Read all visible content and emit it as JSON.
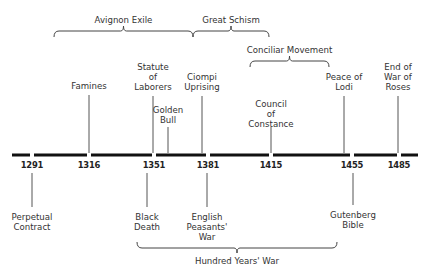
{
  "header": {
    "cropped_title_fragment": ""
  },
  "timeline": {
    "line": {
      "y": 155,
      "x_start": 12,
      "x_end": 418,
      "thickness": 3,
      "color": "#111111"
    },
    "ticks": [
      {
        "year": "1291",
        "x": 32
      },
      {
        "year": "1316",
        "x": 89
      },
      {
        "year": "1351",
        "x": 154
      },
      {
        "year": "1381",
        "x": 208
      },
      {
        "year": "1415",
        "x": 271
      },
      {
        "year": "1455",
        "x": 352
      },
      {
        "year": "1485",
        "x": 399
      }
    ],
    "events_above": [
      {
        "label": "Famines",
        "x": 89,
        "line_top": 95,
        "text_top": 81
      },
      {
        "label": "Statute\nof\nLaborers",
        "x": 153,
        "line_top": 96,
        "text_top": 62
      },
      {
        "label": "Golden\nBull",
        "x": 168,
        "line_top": 127,
        "text_top": 105
      },
      {
        "label": "Ciompi\nUprising",
        "x": 202,
        "line_top": 96,
        "text_top": 72
      },
      {
        "label": "Council\nof\nConstance",
        "x": 271,
        "line_top": 127,
        "text_top": 99
      },
      {
        "label": "Peace of\nLodi",
        "x": 344,
        "line_top": 96,
        "text_top": 72
      },
      {
        "label": "End of\nWar of\nRoses",
        "x": 398,
        "line_top": 96,
        "text_top": 62
      }
    ],
    "events_below": [
      {
        "label": "Perpetual\nContract",
        "x": 32,
        "line_bottom": 207,
        "text_top": 212
      },
      {
        "label": "Black\nDeath",
        "x": 147,
        "line_bottom": 207,
        "text_top": 212
      },
      {
        "label": "English\nPeasants'\nWar",
        "x": 207,
        "line_bottom": 207,
        "text_top": 212
      },
      {
        "label": "Gutenberg\nBible",
        "x": 353,
        "line_bottom": 205,
        "text_top": 210
      }
    ],
    "periods": [
      {
        "label": "Avignon Exile",
        "x1": 54,
        "x2": 193,
        "y": 31,
        "dir": "up",
        "label_y": 15
      },
      {
        "label": "Great Schism",
        "x1": 193,
        "x2": 269,
        "y": 31,
        "dir": "up",
        "label_y": 15
      },
      {
        "label": "Conciliar Movement",
        "x1": 250,
        "x2": 329,
        "y": 61,
        "dir": "up",
        "label_y": 45
      },
      {
        "label": "Hundred Years' War",
        "x1": 137,
        "x2": 337,
        "y": 248,
        "dir": "down",
        "label_y": 256
      }
    ]
  }
}
